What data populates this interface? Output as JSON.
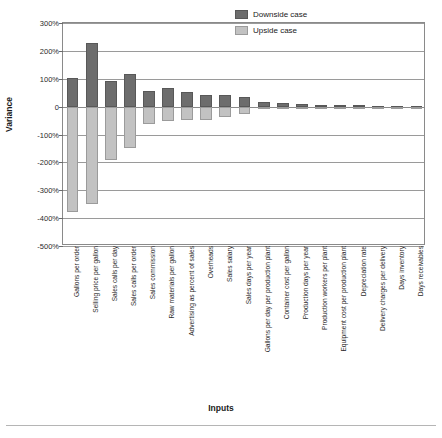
{
  "chart_data": {
    "type": "bar",
    "title": "",
    "xlabel": "Inputs",
    "ylabel": "Variance",
    "ylim": [
      -500,
      300
    ],
    "ytick_labels": [
      "300%",
      "200%",
      "100%",
      "0",
      "-100%",
      "-200%",
      "-300%",
      "-400%",
      "-500%"
    ],
    "ytick_values": [
      300,
      200,
      100,
      0,
      -100,
      -200,
      -300,
      -400,
      -500
    ],
    "grid": true,
    "legend_position": "top-right",
    "units": "percent",
    "categories": [
      "Gallons per order",
      "Selling price per gallon",
      "Sales calls per day",
      "Sales calls per order",
      "Sales commission",
      "Raw materials per gallon",
      "Advertising as percent of sales",
      "Overheads",
      "Sales salary",
      "Sales days per year",
      "Gallons per day per production plant",
      "Container cost per gallon",
      "Production days per year",
      "Production workers per plant",
      "Equipment cost per production plant",
      "Depreciation rate",
      "Delivery charges per delivery",
      "Days inventory",
      "Days receivables"
    ],
    "series": [
      {
        "name": "Downside case",
        "color": "#6d6d6d",
        "values": [
          104,
          228,
          93,
          118,
          56,
          66,
          51,
          40,
          42,
          36,
          15,
          12,
          9,
          7,
          7,
          5,
          4,
          2,
          1
        ]
      },
      {
        "name": "Upside case",
        "color": "#c2c2c2",
        "values": [
          -377,
          -348,
          -190,
          -148,
          -62,
          -50,
          -49,
          -48,
          -38,
          -28,
          -9,
          -8,
          -6,
          -5,
          -5,
          -3,
          -2,
          -1,
          -1
        ]
      }
    ]
  },
  "legend": {
    "entries": [
      {
        "label": "Downside case",
        "swatch": "down"
      },
      {
        "label": "Upside case",
        "swatch": "up"
      }
    ]
  }
}
